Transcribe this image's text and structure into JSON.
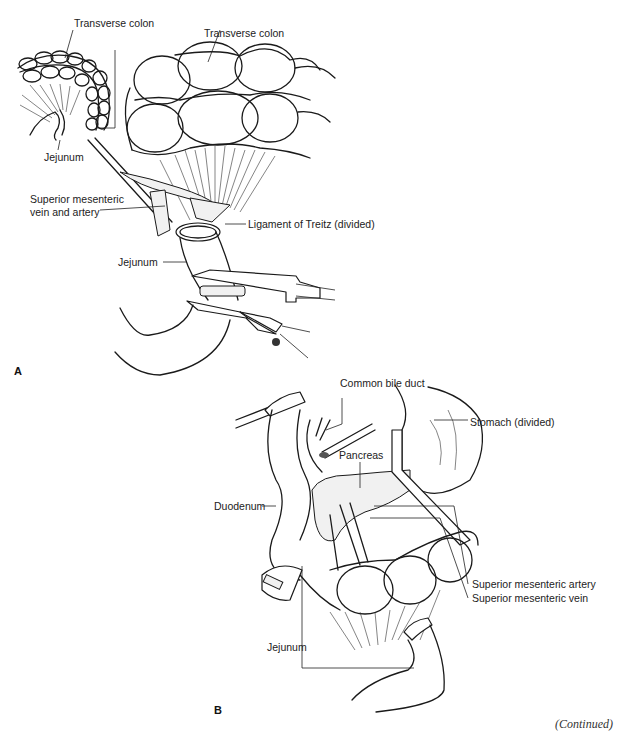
{
  "figure": {
    "panels": [
      {
        "id": "A",
        "label": "A",
        "annotations": [
          {
            "text": "Transverse colon",
            "target": "inset-colon"
          },
          {
            "text": "Transverse colon",
            "target": "main-colon"
          },
          {
            "text": "Jejunum",
            "target": "inset-jejunum"
          },
          {
            "text": "Superior mesenteric",
            "target": "sm-vessels"
          },
          {
            "text": "vein and artery",
            "target": "sm-vessels"
          },
          {
            "text": "Ligament of Treitz (divided)",
            "target": "ligament"
          },
          {
            "text": "Jejunum",
            "target": "jejunum-clamped"
          }
        ]
      },
      {
        "id": "B",
        "label": "B",
        "annotations": [
          {
            "text": "Common bile duct",
            "target": "bile-duct"
          },
          {
            "text": "Stomach (divided)",
            "target": "stomach"
          },
          {
            "text": "Pancreas",
            "target": "pancreas"
          },
          {
            "text": "Duodenum",
            "target": "duodenum"
          },
          {
            "text": "Superior mesenteric artery",
            "target": "sma"
          },
          {
            "text": "Superior mesenteric vein",
            "target": "smv"
          },
          {
            "text": "Jejunum",
            "target": "jejunum"
          }
        ]
      }
    ],
    "footer": {
      "continued": "(Continued)"
    }
  }
}
